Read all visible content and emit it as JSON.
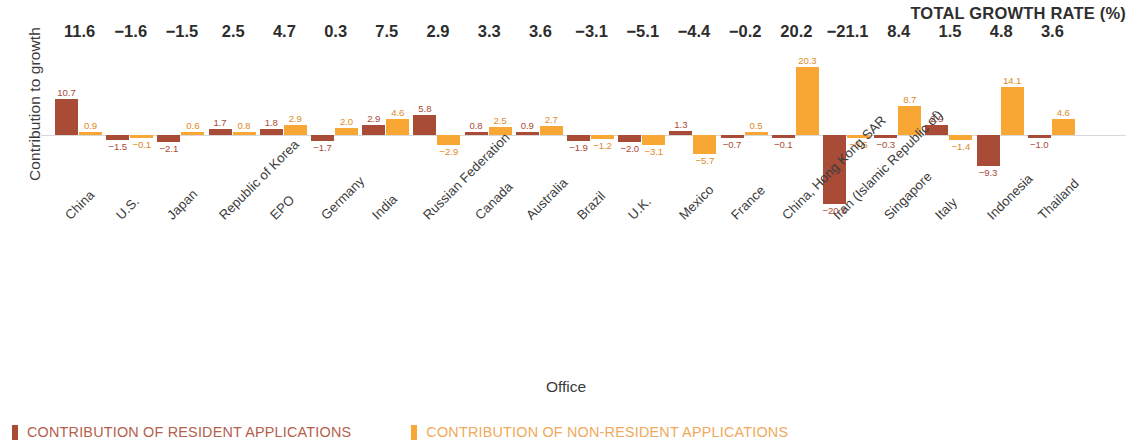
{
  "axes": {
    "y_title": "Contribution to growth",
    "x_title": "Office"
  },
  "header": {
    "growth_rate_title": "TOTAL GROWTH RATE (%)"
  },
  "legend": {
    "resident": "CONTRIBUTION OF RESIDENT APPLICATIONS",
    "non_resident": "CONTRIBUTION OF NON-RESIDENT APPLICATIONS",
    "resident_color": "#a84b37",
    "non_resident_color": "#f9a734"
  },
  "chart_data": {
    "type": "bar",
    "title": "",
    "subtitle": "",
    "xlabel": "Office",
    "ylabel": "Contribution to growth",
    "grid": false,
    "legend_position": "bottom-left",
    "baseline": 0,
    "ylim": [
      -21.5,
      21.5
    ],
    "categories": [
      "China",
      "U.S.",
      "Japan",
      "Republic of Korea",
      "EPO",
      "Germany",
      "India",
      "Russian Federation",
      "Canada",
      "Australia",
      "Brazil",
      "U.K.",
      "Mexico",
      "France",
      "China, Hong Kong SAR",
      "Iran (Islamic Republic of)",
      "Singapore",
      "Italy",
      "Indonesia",
      "Thailand"
    ],
    "series": [
      {
        "name": "CONTRIBUTION OF RESIDENT APPLICATIONS",
        "color": "#a84b37",
        "values": [
          10.7,
          -1.5,
          -2.1,
          1.7,
          1.8,
          -1.7,
          2.9,
          5.8,
          0.8,
          0.9,
          -1.9,
          -2.0,
          1.3,
          -0.7,
          -0.1,
          -20.6,
          -0.3,
          2.9,
          -9.3,
          -1.0
        ],
        "labels": [
          "10.7",
          "−1.5",
          "−2.1",
          "1.7",
          "1.8",
          "−1.7",
          "2.9",
          "5.8",
          "0.8",
          "0.9",
          "−1.9",
          "−2.0",
          "1.3",
          "−0.7",
          "−0.1",
          "−20.6",
          "−0.3",
          "2.9",
          "−9.3",
          "−1.0"
        ]
      },
      {
        "name": "CONTRIBUTION OF NON-RESIDENT APPLICATIONS",
        "color": "#f9a734",
        "values": [
          0.9,
          -0.1,
          0.6,
          0.8,
          2.9,
          2.0,
          4.6,
          -2.9,
          2.5,
          2.7,
          -1.2,
          -3.1,
          -5.7,
          0.5,
          20.3,
          -0.5,
          8.7,
          -1.4,
          14.1,
          4.6
        ],
        "labels": [
          "0.9",
          "−0.1",
          "0.6",
          "0.8",
          "2.9",
          "2.0",
          "4.6",
          "−2.9",
          "2.5",
          "2.7",
          "−1.2",
          "−3.1",
          "−5.7",
          "0.5",
          "20.3",
          "−0.5",
          "8.7",
          "−1.4",
          "14.1",
          "4.6"
        ]
      }
    ],
    "total_growth_rate": {
      "name": "TOTAL GROWTH RATE (%)",
      "values": [
        11.6,
        -1.6,
        -1.5,
        2.5,
        4.7,
        0.3,
        7.5,
        2.9,
        3.3,
        3.6,
        -3.1,
        -5.1,
        -4.4,
        -0.2,
        20.2,
        -21.1,
        8.4,
        1.5,
        4.8,
        3.6
      ],
      "labels": [
        "11.6",
        "−1.6",
        "−1.5",
        "2.5",
        "4.7",
        "0.3",
        "7.5",
        "2.9",
        "3.3",
        "3.6",
        "−3.1",
        "−5.1",
        "−4.4",
        "−0.2",
        "20.2",
        "−21.1",
        "8.4",
        "1.5",
        "4.8",
        "3.6"
      ]
    }
  }
}
